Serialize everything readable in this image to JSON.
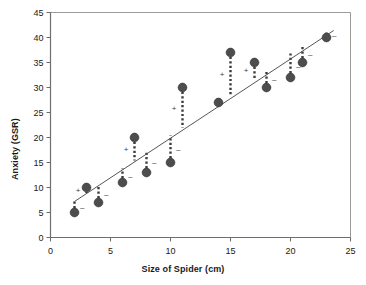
{
  "chart_data": {
    "type": "scatter",
    "title": "",
    "xlabel": "Size of Spider (cm)",
    "ylabel": "Anxiety (GSR)",
    "xlim": [
      0,
      25
    ],
    "ylim": [
      0,
      45
    ],
    "xticks": [
      0,
      5,
      10,
      15,
      20,
      25
    ],
    "yticks": [
      0,
      5,
      10,
      15,
      20,
      25,
      30,
      35,
      40,
      45
    ],
    "grid": false,
    "legend": null,
    "marker_color": "#4d4d4d",
    "line_color": "#555555",
    "residual_style": "dotted",
    "points": [
      {
        "x": 2,
        "y": 5,
        "fit": 7.2,
        "residual_sign": "-"
      },
      {
        "x": 3,
        "y": 10,
        "fit": 8.9,
        "residual_sign": "+"
      },
      {
        "x": 4,
        "y": 7,
        "fit": 10.5,
        "residual_sign": "-"
      },
      {
        "x": 6,
        "y": 11,
        "fit": 13.8,
        "residual_sign": "-"
      },
      {
        "x": 7,
        "y": 20,
        "fit": 15.4,
        "residual_sign": "+"
      },
      {
        "x": 8,
        "y": 13,
        "fit": 17.1,
        "residual_sign": "-"
      },
      {
        "x": 10,
        "y": 15,
        "fit": 20.4,
        "residual_sign": "-"
      },
      {
        "x": 11,
        "y": 30,
        "fit": 22.0,
        "residual_sign": "+"
      },
      {
        "x": 14,
        "y": 27,
        "fit": 27.0,
        "residual_sign": "0"
      },
      {
        "x": 15,
        "y": 37,
        "fit": 28.6,
        "residual_sign": "+"
      },
      {
        "x": 17,
        "y": 35,
        "fit": 31.9,
        "residual_sign": "+"
      },
      {
        "x": 18,
        "y": 30,
        "fit": 33.5,
        "residual_sign": "-"
      },
      {
        "x": 20,
        "y": 32,
        "fit": 36.8,
        "residual_sign": "-"
      },
      {
        "x": 21,
        "y": 35,
        "fit": 38.5,
        "residual_sign": "-"
      },
      {
        "x": 23,
        "y": 40,
        "fit": 41.0,
        "residual_sign": "-"
      }
    ],
    "regression_line": {
      "x_start": 2,
      "y_start": 7.2,
      "x_end": 23.6,
      "y_end": 41.4,
      "slope": 1.65,
      "intercept": 3.9
    }
  }
}
